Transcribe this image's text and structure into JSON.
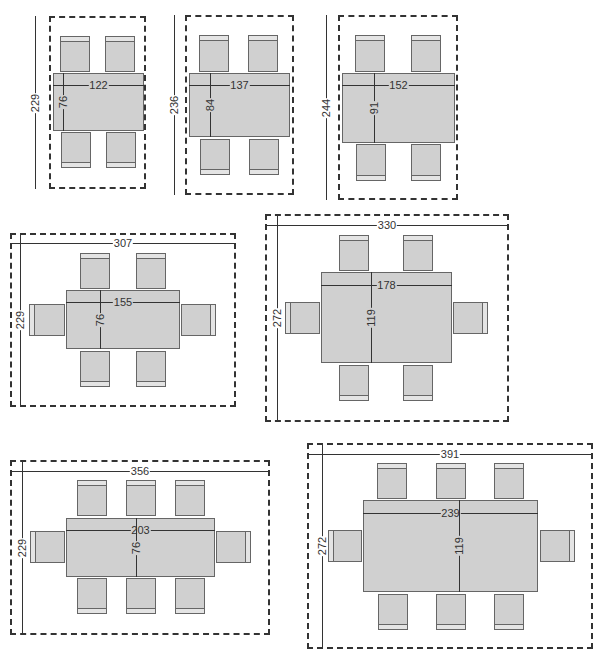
{
  "units": "cm",
  "layouts": [
    {
      "id": "4-seat-122",
      "seats": 4,
      "room": {
        "x": 49,
        "y": 16,
        "w": 97,
        "h": 173
      },
      "table": {
        "x": 53,
        "y": 73,
        "w": 91,
        "h": 58
      },
      "room_depth_label": "229",
      "room_width_label": "",
      "table_width_label": "122",
      "table_depth_label": "76",
      "room_dim_line": {
        "orient": "v",
        "x": 35,
        "y1": 16,
        "y2": 189
      },
      "table_w_line": {
        "y": 85,
        "x1": 53,
        "x2": 144
      },
      "table_d_line": {
        "x": 63,
        "y1": 73,
        "y2": 131
      },
      "chairs": [
        {
          "x": 60,
          "y": 36,
          "w": 30,
          "h": 36,
          "back": "top"
        },
        {
          "x": 105,
          "y": 36,
          "w": 30,
          "h": 36,
          "back": "top"
        },
        {
          "x": 61,
          "y": 132,
          "w": 30,
          "h": 36,
          "back": "bottom"
        },
        {
          "x": 106,
          "y": 132,
          "w": 30,
          "h": 36,
          "back": "bottom"
        }
      ]
    },
    {
      "id": "4-seat-137",
      "seats": 4,
      "room": {
        "x": 185,
        "y": 15,
        "w": 109,
        "h": 180
      },
      "table": {
        "x": 189,
        "y": 73,
        "w": 101,
        "h": 64
      },
      "room_depth_label": "236",
      "room_width_label": "",
      "table_width_label": "137",
      "table_depth_label": "84",
      "room_dim_line": {
        "orient": "v",
        "x": 174,
        "y1": 15,
        "y2": 195
      },
      "table_w_line": {
        "y": 85,
        "x1": 189,
        "x2": 290
      },
      "table_d_line": {
        "x": 210,
        "y1": 73,
        "y2": 137
      },
      "chairs": [
        {
          "x": 199,
          "y": 35,
          "w": 30,
          "h": 37,
          "back": "top"
        },
        {
          "x": 248,
          "y": 35,
          "w": 30,
          "h": 37,
          "back": "top"
        },
        {
          "x": 200,
          "y": 139,
          "w": 30,
          "h": 36,
          "back": "bottom"
        },
        {
          "x": 249,
          "y": 139,
          "w": 30,
          "h": 36,
          "back": "bottom"
        }
      ]
    },
    {
      "id": "4-seat-152",
      "seats": 4,
      "room": {
        "x": 338,
        "y": 15,
        "w": 120,
        "h": 185
      },
      "table": {
        "x": 342,
        "y": 73,
        "w": 113,
        "h": 70
      },
      "room_depth_label": "244",
      "room_width_label": "",
      "table_width_label": "152",
      "table_depth_label": "91",
      "room_dim_line": {
        "orient": "v",
        "x": 326,
        "y1": 15,
        "y2": 200
      },
      "table_w_line": {
        "y": 85,
        "x1": 342,
        "x2": 455
      },
      "table_d_line": {
        "x": 374,
        "y1": 73,
        "y2": 143
      },
      "chairs": [
        {
          "x": 355,
          "y": 35,
          "w": 30,
          "h": 37,
          "back": "top"
        },
        {
          "x": 411,
          "y": 35,
          "w": 30,
          "h": 37,
          "back": "top"
        },
        {
          "x": 356,
          "y": 144,
          "w": 30,
          "h": 37,
          "back": "bottom"
        },
        {
          "x": 411,
          "y": 144,
          "w": 30,
          "h": 37,
          "back": "bottom"
        }
      ]
    },
    {
      "id": "6-seat-155",
      "seats": 6,
      "room": {
        "x": 10,
        "y": 233,
        "w": 226,
        "h": 174
      },
      "table": {
        "x": 66,
        "y": 290,
        "w": 114,
        "h": 59
      },
      "room_depth_label": "229",
      "room_width_label": "307",
      "table_width_label": "155",
      "table_depth_label": "76",
      "room_dim_line": {
        "orient": "v",
        "x": 20,
        "y1": 233,
        "y2": 407
      },
      "room_w_line": {
        "y": 243,
        "x1": 10,
        "x2": 236
      },
      "table_w_line": {
        "y": 302,
        "x1": 66,
        "x2": 180
      },
      "table_d_line": {
        "x": 100,
        "y1": 290,
        "y2": 349
      },
      "chairs": [
        {
          "x": 80,
          "y": 253,
          "w": 30,
          "h": 36,
          "back": "top"
        },
        {
          "x": 136,
          "y": 253,
          "w": 30,
          "h": 36,
          "back": "top"
        },
        {
          "x": 80,
          "y": 351,
          "w": 30,
          "h": 36,
          "back": "bottom"
        },
        {
          "x": 136,
          "y": 351,
          "w": 30,
          "h": 36,
          "back": "bottom"
        },
        {
          "x": 29,
          "y": 304,
          "w": 36,
          "h": 32,
          "back": "left"
        },
        {
          "x": 181,
          "y": 304,
          "w": 35,
          "h": 32,
          "back": "right"
        }
      ]
    },
    {
      "id": "6-seat-178",
      "seats": 6,
      "room": {
        "x": 265,
        "y": 214,
        "w": 244,
        "h": 208
      },
      "table": {
        "x": 321,
        "y": 272,
        "w": 131,
        "h": 91
      },
      "room_depth_label": "272",
      "room_width_label": "330",
      "table_width_label": "178",
      "table_depth_label": "119",
      "room_dim_line": {
        "orient": "v",
        "x": 277,
        "y1": 214,
        "y2": 422
      },
      "room_w_line": {
        "y": 225,
        "x1": 265,
        "x2": 509
      },
      "table_w_line": {
        "y": 285,
        "x1": 321,
        "x2": 452
      },
      "table_d_line": {
        "x": 371,
        "y1": 272,
        "y2": 363
      },
      "chairs": [
        {
          "x": 339,
          "y": 235,
          "w": 30,
          "h": 36,
          "back": "top"
        },
        {
          "x": 403,
          "y": 235,
          "w": 30,
          "h": 36,
          "back": "top"
        },
        {
          "x": 339,
          "y": 365,
          "w": 30,
          "h": 36,
          "back": "bottom"
        },
        {
          "x": 403,
          "y": 365,
          "w": 30,
          "h": 36,
          "back": "bottom"
        },
        {
          "x": 285,
          "y": 302,
          "w": 35,
          "h": 32,
          "back": "left"
        },
        {
          "x": 453,
          "y": 302,
          "w": 35,
          "h": 32,
          "back": "right"
        }
      ]
    },
    {
      "id": "8-seat-203",
      "seats": 8,
      "room": {
        "x": 10,
        "y": 460,
        "w": 260,
        "h": 175
      },
      "table": {
        "x": 66,
        "y": 518,
        "w": 149,
        "h": 59
      },
      "room_depth_label": "229",
      "room_width_label": "356",
      "table_width_label": "203",
      "table_depth_label": "76",
      "room_dim_line": {
        "orient": "v",
        "x": 22,
        "y1": 460,
        "y2": 635
      },
      "room_w_line": {
        "y": 471,
        "x1": 10,
        "x2": 270
      },
      "table_w_line": {
        "y": 530,
        "x1": 66,
        "x2": 215
      },
      "table_d_line": {
        "x": 136,
        "y1": 518,
        "y2": 577
      },
      "chairs": [
        {
          "x": 77,
          "y": 480,
          "w": 30,
          "h": 36,
          "back": "top"
        },
        {
          "x": 126,
          "y": 480,
          "w": 30,
          "h": 36,
          "back": "top"
        },
        {
          "x": 175,
          "y": 480,
          "w": 30,
          "h": 36,
          "back": "top"
        },
        {
          "x": 77,
          "y": 578,
          "w": 30,
          "h": 36,
          "back": "bottom"
        },
        {
          "x": 126,
          "y": 578,
          "w": 30,
          "h": 36,
          "back": "bottom"
        },
        {
          "x": 175,
          "y": 578,
          "w": 30,
          "h": 36,
          "back": "bottom"
        },
        {
          "x": 30,
          "y": 531,
          "w": 35,
          "h": 32,
          "back": "left"
        },
        {
          "x": 216,
          "y": 531,
          "w": 35,
          "h": 32,
          "back": "right"
        }
      ]
    },
    {
      "id": "8-seat-239",
      "seats": 8,
      "room": {
        "x": 307,
        "y": 443,
        "w": 286,
        "h": 206
      },
      "table": {
        "x": 363,
        "y": 500,
        "w": 175,
        "h": 92
      },
      "room_depth_label": "272",
      "room_width_label": "391",
      "table_width_label": "239",
      "table_depth_label": "119",
      "room_dim_line": {
        "orient": "v",
        "x": 322,
        "y1": 443,
        "y2": 649
      },
      "room_w_line": {
        "y": 454,
        "x1": 307,
        "x2": 593
      },
      "table_w_line": {
        "y": 513,
        "x1": 363,
        "x2": 538
      },
      "table_d_line": {
        "x": 459,
        "y1": 500,
        "y2": 592
      },
      "chairs": [
        {
          "x": 377,
          "y": 463,
          "w": 30,
          "h": 36,
          "back": "top"
        },
        {
          "x": 436,
          "y": 463,
          "w": 30,
          "h": 36,
          "back": "top"
        },
        {
          "x": 494,
          "y": 463,
          "w": 30,
          "h": 36,
          "back": "top"
        },
        {
          "x": 378,
          "y": 594,
          "w": 30,
          "h": 36,
          "back": "bottom"
        },
        {
          "x": 436,
          "y": 594,
          "w": 30,
          "h": 36,
          "back": "bottom"
        },
        {
          "x": 494,
          "y": 594,
          "w": 30,
          "h": 36,
          "back": "bottom"
        },
        {
          "x": 328,
          "y": 530,
          "w": 34,
          "h": 32,
          "back": "left"
        },
        {
          "x": 540,
          "y": 530,
          "w": 35,
          "h": 32,
          "back": "right"
        }
      ]
    }
  ]
}
